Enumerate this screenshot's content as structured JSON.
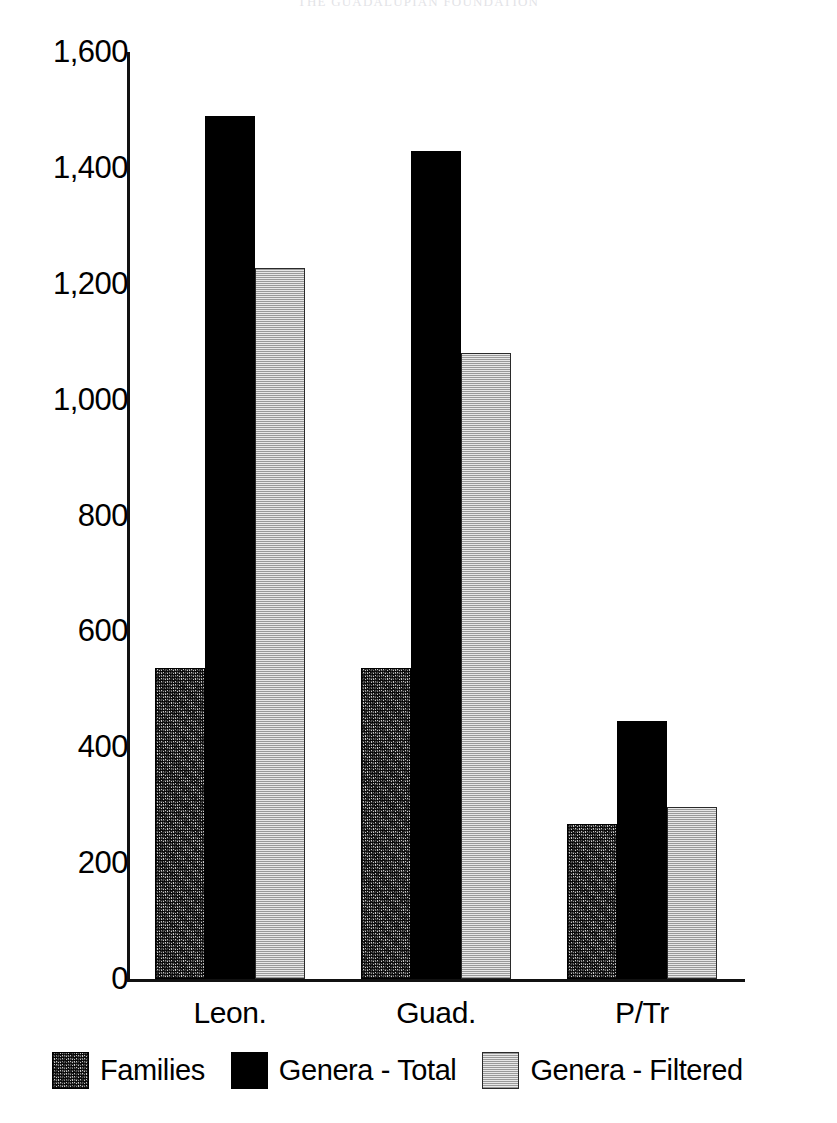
{
  "header": {
    "running_title": "THE GUADALUPIAN FOUNDATION"
  },
  "chart_data": {
    "type": "bar",
    "title": "",
    "subtitle": "",
    "xlabel": "",
    "ylabel": "",
    "categories": [
      "Leon.",
      "Guad.",
      "P/Tr"
    ],
    "series": [
      {
        "name": "Families",
        "values": [
          536,
          536,
          268
        ],
        "swatch": "dark-speckle"
      },
      {
        "name": "Genera - Total",
        "values": [
          1490,
          1429,
          446
        ],
        "swatch": "solid-black"
      },
      {
        "name": "Genera - Filtered",
        "values": [
          1228,
          1080,
          297
        ],
        "swatch": "light-dotted"
      }
    ],
    "ylim": [
      0,
      1600
    ],
    "yticks": [
      1600,
      1400,
      1200,
      1000,
      800,
      600,
      400,
      200,
      0
    ],
    "ytick_labels": [
      "1,600",
      "1,400",
      "1,200",
      "1,000",
      "800",
      "600",
      "400",
      "200",
      "0"
    ],
    "grid": false,
    "legend_position": "bottom",
    "colors": {
      "families": "#8a8a8a",
      "genera_total": "#000000",
      "genera_filtered": "#d8d8d8",
      "axis": "#111111",
      "background": "#ffffff"
    }
  }
}
